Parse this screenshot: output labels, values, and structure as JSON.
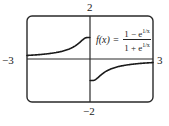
{
  "chart_data": {
    "type": "line",
    "title": "",
    "function_label": "f(x) = (1 - e^(1/x)) / (1 + e^(1/x))",
    "formula": {
      "lhs": "f(x) =",
      "numerator_text": "1 − e",
      "denominator_text": "1 + e",
      "exponent": "1/x"
    },
    "xlabel": "",
    "ylabel": "",
    "xlim": [
      -3,
      3
    ],
    "ylim": [
      -2,
      2
    ],
    "tick_labels": {
      "x_min": "−3",
      "x_max": "3",
      "y_min": "−2",
      "y_max": "2"
    },
    "grid": false,
    "legend": "none",
    "series": [
      {
        "name": "f(x) left branch (x<0)",
        "x": [
          -3,
          -2.5,
          -2,
          -1.5,
          -1,
          -0.75,
          -0.5,
          -0.4,
          -0.3,
          -0.2,
          -0.1,
          -0.01
        ],
        "y": [
          0.165,
          0.197,
          0.245,
          0.322,
          0.462,
          0.583,
          0.762,
          0.848,
          0.931,
          0.987,
          1.0,
          1.0
        ]
      },
      {
        "name": "f(x) right branch (x>0)",
        "x": [
          0.01,
          0.1,
          0.2,
          0.3,
          0.4,
          0.5,
          0.75,
          1,
          1.5,
          2,
          2.5,
          3
        ],
        "y": [
          -1.0,
          -1.0,
          -0.987,
          -0.931,
          -0.848,
          -0.762,
          -0.583,
          -0.462,
          -0.322,
          -0.245,
          -0.197,
          -0.165
        ]
      }
    ],
    "annotations": [
      "Jump discontinuity at x = 0: limit from left = 1, limit from right = −1"
    ]
  },
  "colors": {
    "curve": "#1a1a1a",
    "axes": "#2a2a2a",
    "frame": "#2a2a2a",
    "background": "#ffffff"
  },
  "frame_px": {
    "left": 27,
    "top": 16,
    "right": 153,
    "bottom": 102
  }
}
